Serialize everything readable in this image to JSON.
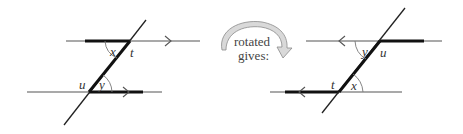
{
  "figure_left": {
    "labels": {
      "x": "x",
      "t": "t",
      "u": "u",
      "y": "y"
    }
  },
  "rotation": {
    "caption_line1": "rotated",
    "caption_line2": "gives:",
    "icon": "curved-rotate-arrow-icon",
    "arrow_fill": "#d9d9d9",
    "arrow_stroke": "#8a8a8a"
  },
  "figure_right": {
    "labels": {
      "y": "y",
      "u": "u",
      "t": "t",
      "x": "x"
    }
  },
  "colors": {
    "line": "#555555",
    "thick": "#111111",
    "text": "#333333"
  }
}
